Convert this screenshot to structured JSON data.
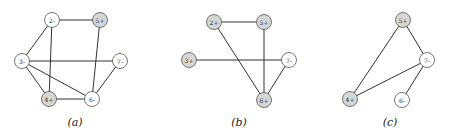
{
  "colors": {
    "positive_fill": "#d6d6d6",
    "negative_fill": "#ffffff",
    "edge": "#333333"
  },
  "graphs": [
    {
      "caption": "(a)",
      "caption_pos": [
        75,
        126
      ],
      "nodes": [
        {
          "id": "2",
          "label": "2-",
          "x": 52,
          "y": 20,
          "sign": "-"
        },
        {
          "id": "5",
          "label": "5+",
          "x": 100,
          "y": 20,
          "sign": "+"
        },
        {
          "id": "3",
          "label": "3-",
          "x": 22,
          "y": 61,
          "sign": "-"
        },
        {
          "id": "7",
          "label": "7-",
          "x": 120,
          "y": 61,
          "sign": "-"
        },
        {
          "id": "4",
          "label": "4+",
          "x": 49,
          "y": 99,
          "sign": "+"
        },
        {
          "id": "6",
          "label": "6-",
          "x": 92,
          "y": 99,
          "sign": "-"
        }
      ],
      "edges": [
        [
          "2",
          "5"
        ],
        [
          "2",
          "3"
        ],
        [
          "2",
          "4"
        ],
        [
          "5",
          "6"
        ],
        [
          "3",
          "7"
        ],
        [
          "3",
          "4"
        ],
        [
          "3",
          "6"
        ],
        [
          "4",
          "6"
        ],
        [
          "7",
          "6"
        ]
      ]
    },
    {
      "caption": "(b)",
      "caption_pos": [
        239,
        126
      ],
      "nodes": [
        {
          "id": "2",
          "label": "2+",
          "x": 214,
          "y": 22,
          "sign": "+"
        },
        {
          "id": "5",
          "label": "5+",
          "x": 264,
          "y": 22,
          "sign": "+"
        },
        {
          "id": "3",
          "label": "3+",
          "x": 189,
          "y": 60,
          "sign": "+"
        },
        {
          "id": "7",
          "label": "7-",
          "x": 289,
          "y": 60,
          "sign": "-"
        },
        {
          "id": "6",
          "label": "6+",
          "x": 264,
          "y": 100,
          "sign": "+"
        }
      ],
      "edges": [
        [
          "2",
          "5"
        ],
        [
          "2",
          "6"
        ],
        [
          "5",
          "6"
        ],
        [
          "3",
          "7"
        ],
        [
          "7",
          "6"
        ]
      ]
    },
    {
      "caption": "(c)",
      "caption_pos": [
        390,
        126
      ],
      "nodes": [
        {
          "id": "5",
          "label": "5+",
          "x": 403,
          "y": 20,
          "sign": "+"
        },
        {
          "id": "7",
          "label": "7-",
          "x": 427,
          "y": 60,
          "sign": "-"
        },
        {
          "id": "4",
          "label": "4+",
          "x": 350,
          "y": 99,
          "sign": "+"
        },
        {
          "id": "6",
          "label": "6-",
          "x": 402,
          "y": 100,
          "sign": "-"
        }
      ],
      "edges": [
        [
          "5",
          "7"
        ],
        [
          "5",
          "4"
        ],
        [
          "7",
          "4"
        ],
        [
          "7",
          "6"
        ]
      ]
    }
  ]
}
